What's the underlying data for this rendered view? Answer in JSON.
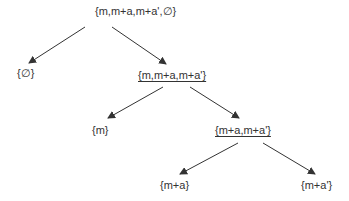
{
  "diagram": {
    "type": "tree",
    "nodes": [
      {
        "id": "root",
        "label": "{m,m+a,m+a',∅}",
        "underlined": false,
        "x": 95,
        "y": 5
      },
      {
        "id": "empty",
        "label": "{∅}",
        "underlined": false,
        "x": 17,
        "y": 67
      },
      {
        "id": "n1",
        "label": "{m,m+a,m+a'}",
        "underlined": true,
        "x": 138,
        "y": 69
      },
      {
        "id": "m",
        "label": "{m}",
        "underlined": false,
        "x": 92,
        "y": 124
      },
      {
        "id": "n2",
        "label": "{m+a,m+a'}",
        "underlined": true,
        "x": 215,
        "y": 124
      },
      {
        "id": "ma",
        "label": "{m+a}",
        "underlined": false,
        "x": 160,
        "y": 179
      },
      {
        "id": "map",
        "label": "{m+a'}",
        "underlined": false,
        "x": 301,
        "y": 179
      }
    ],
    "edges": [
      {
        "from": "root",
        "to": "empty",
        "x1": 85,
        "y1": 27,
        "x2": 29,
        "y2": 63
      },
      {
        "from": "root",
        "to": "n1",
        "x1": 112,
        "y1": 27,
        "x2": 166,
        "y2": 64
      },
      {
        "from": "n1",
        "to": "m",
        "x1": 163,
        "y1": 87,
        "x2": 108,
        "y2": 118
      },
      {
        "from": "n1",
        "to": "n2",
        "x1": 190,
        "y1": 87,
        "x2": 239,
        "y2": 118
      },
      {
        "from": "n2",
        "to": "ma",
        "x1": 238,
        "y1": 143,
        "x2": 180,
        "y2": 174
      },
      {
        "from": "n2",
        "to": "map",
        "x1": 263,
        "y1": 143,
        "x2": 315,
        "y2": 174
      }
    ],
    "colors": {
      "line": "#333333",
      "text": "#333333",
      "background": "#ffffff"
    }
  }
}
